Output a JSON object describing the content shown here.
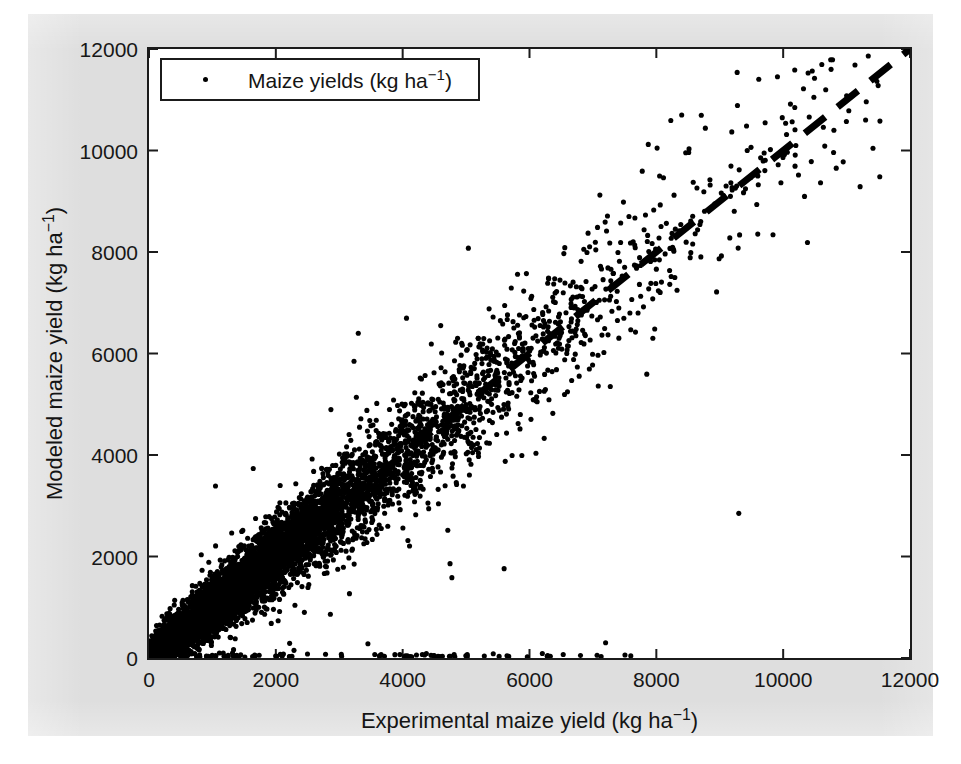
{
  "figure": {
    "background_color": "#dedede",
    "axes_background_color": "#ffffff",
    "axis_color": "#1b1b1b",
    "marker_color": "#000000"
  },
  "legend": {
    "marker_icon": "dot-marker-icon",
    "label_text": "Maize yields (kg ha",
    "label_exponent": "−1",
    "label_close": ")",
    "position": "northwest"
  },
  "axes": {
    "x_title_text": "Experimental maize yield (kg ha",
    "x_title_exponent": "−1",
    "x_title_close": ")",
    "y_title_text": "Modeled maize yield (kg ha",
    "y_title_exponent": "−1",
    "y_title_close": ")",
    "x_ticks": [
      "0",
      "2000",
      "4000",
      "6000",
      "8000",
      "10000",
      "12000"
    ],
    "y_ticks": [
      "0",
      "2000",
      "4000",
      "6000",
      "8000",
      "10000",
      "12000"
    ]
  },
  "chart_data": {
    "type": "scatter",
    "title": "",
    "xlabel": "Experimental maize yield (kg ha−1)",
    "ylabel": "Modeled maize yield (kg ha−1)",
    "xlim": [
      0,
      12000
    ],
    "ylim": [
      0,
      12000
    ],
    "xticks": [
      0,
      2000,
      4000,
      6000,
      8000,
      10000,
      12000
    ],
    "yticks": [
      0,
      2000,
      4000,
      6000,
      8000,
      10000,
      12000
    ],
    "grid": false,
    "legend_position": "upper left",
    "series": [
      {
        "name": "Maize yields (kg ha−1)",
        "marker": "point",
        "color": "#000000",
        "point_count": 5200,
        "description": "Dense 1:1 scatter cloud of modeled vs experimental maize yields; correlation approximately 0.93, scatter widens with yield, plus a band of zero-modeled-yield outliers along y=0 for x up to roughly 7500.",
        "distribution": {
          "x_mode": "exponential-like, concentrated 0-6000, tail to 11500",
          "y_given_x": "y = x + noise, noise sd grows from ~200 at x=0 to ~900 at x=9000",
          "zero_band_fraction": 0.045,
          "zero_band_x_range": [
            0,
            7600
          ]
        },
        "representative_points": [
          [
            150,
            180
          ],
          [
            420,
            470
          ],
          [
            780,
            820
          ],
          [
            1100,
            1250
          ],
          [
            1500,
            1430
          ],
          [
            1900,
            2050
          ],
          [
            2300,
            2180
          ],
          [
            2700,
            2900
          ],
          [
            3100,
            3050
          ],
          [
            3500,
            3700
          ],
          [
            3900,
            3850
          ],
          [
            4300,
            4450
          ],
          [
            4700,
            4600
          ],
          [
            5100,
            5350
          ],
          [
            5500,
            5420
          ],
          [
            5900,
            6100
          ],
          [
            6300,
            6250
          ],
          [
            6700,
            6900
          ],
          [
            7100,
            7050
          ],
          [
            7500,
            7700
          ],
          [
            7900,
            7850
          ],
          [
            8300,
            8450
          ],
          [
            8700,
            8600
          ],
          [
            9100,
            9300
          ],
          [
            9600,
            9500
          ],
          [
            10200,
            10100
          ],
          [
            10800,
            10400
          ],
          [
            11300,
            10600
          ],
          [
            4600,
            6550
          ],
          [
            3300,
            6400
          ],
          [
            8400,
            10700
          ],
          [
            9300,
            2850
          ],
          [
            2450,
            900
          ],
          [
            7200,
            300
          ],
          [
            9700,
            9950
          ]
        ]
      }
    ],
    "reference_line": {
      "name": "1:1 line",
      "style": "dashed",
      "color": "#000000",
      "width_px": 7,
      "from": [
        0,
        0
      ],
      "to": [
        12000,
        12000
      ]
    }
  }
}
